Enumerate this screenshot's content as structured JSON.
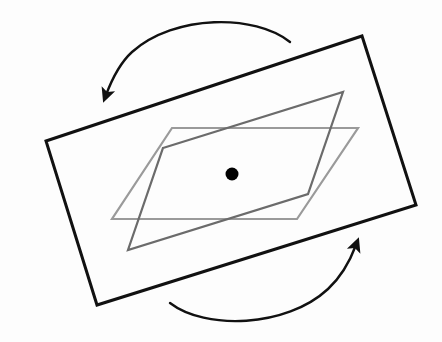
{
  "figure": {
    "width": 442,
    "height": 342,
    "background_color": "#fdfdfd",
    "type": "geometric-diagram"
  },
  "colors": {
    "outline_black": "#111111",
    "parallelogram_dark_gray": "#6b6b6b",
    "parallelogram_light_gray": "#9a9a9a",
    "center_dot": "#000000",
    "arrow": "#111111"
  },
  "shapes": {
    "rectangle": {
      "name": "outer-rectangle",
      "stroke": "#111111",
      "stroke_width": 3,
      "fill": "none",
      "rotation_degrees": -13,
      "points": "46,141 362,36 416,205 97,305"
    },
    "parallelogram_dark": {
      "name": "inner-parallelogram-dark",
      "stroke": "#6b6b6b",
      "stroke_width": 2.2,
      "fill": "none",
      "points": "163,148 343,92 308,194 128,250"
    },
    "parallelogram_light": {
      "name": "inner-parallelogram-light",
      "stroke": "#9a9a9a",
      "stroke_width": 2.2,
      "fill": "none",
      "points": "172,128 358,128 297,219 112,219"
    },
    "center_dot": {
      "name": "center-point",
      "cx": 232,
      "cy": 174,
      "r": 6.5,
      "fill": "#000000"
    }
  },
  "arrows": [
    {
      "name": "rotation-arrow-top",
      "label": "counter-clockwise top arc",
      "direction": "left-down",
      "path": "M 290,42 C 255,14 175,14 132,52 C 120,63 112,79 106,95",
      "tip": {
        "x": 105,
        "y": 102
      },
      "tip_angle_degrees": 108,
      "stroke": "#111111",
      "stroke_width": 2.4
    },
    {
      "name": "rotation-arrow-bottom",
      "label": "counter-clockwise bottom arc",
      "direction": "right-up",
      "path": "M 170,303 C 205,330 286,328 328,289 C 341,277 350,261 356,245",
      "tip": {
        "x": 358,
        "y": 237
      },
      "tip_angle_degrees": -72,
      "stroke": "#111111",
      "stroke_width": 2.4
    }
  ],
  "labels": {
    "alt_text": "A tilted black rectangle with two overlapping gray parallelograms inside, a filled black dot at the center, and two curved arrows above and below indicating rotation about the center point."
  }
}
